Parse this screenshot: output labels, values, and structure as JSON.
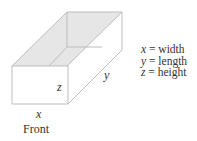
{
  "diagram": {
    "type": "open-top rectangular box",
    "labels": {
      "x": "x",
      "y": "y",
      "z": "z",
      "front": "Front"
    },
    "legend": [
      {
        "var": "x",
        "eq": "=",
        "meaning": "width"
      },
      {
        "var": "y",
        "eq": "=",
        "meaning": "length"
      },
      {
        "var": "z",
        "eq": "=",
        "meaning": "height"
      }
    ],
    "colors": {
      "edge": "#bdbdbd",
      "shade": "#e6e6e6",
      "text": "#333333"
    }
  }
}
